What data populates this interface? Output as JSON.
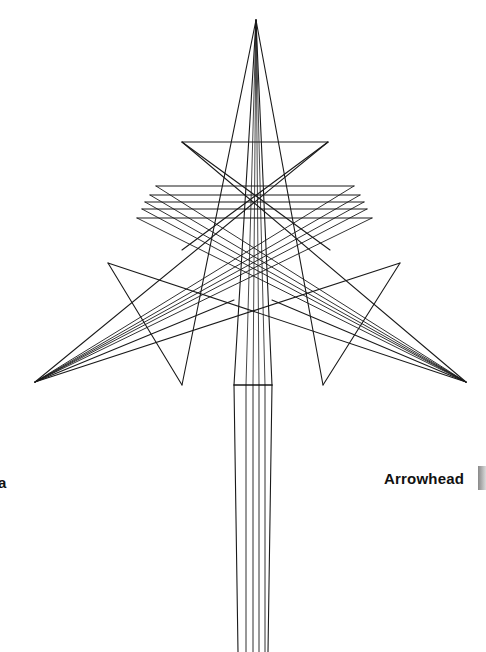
{
  "figure": {
    "title": "Arrowhead",
    "labels": {
      "right": "Arrowhead",
      "left_partial": "a"
    },
    "stroke_color": "#1a1a1a",
    "background": "#ffffff",
    "apex": [
      256,
      20
    ],
    "upper_triangle": {
      "top_left": [
        182,
        142
      ],
      "top_right": [
        328,
        142
      ],
      "bottom": [
        256,
        250
      ]
    },
    "stacked_bars": [
      {
        "y": 186,
        "x1": 156,
        "x2": 354
      },
      {
        "y": 195,
        "x1": 150,
        "x2": 360
      },
      {
        "y": 202,
        "x1": 145,
        "x2": 364
      },
      {
        "y": 209,
        "x1": 142,
        "x2": 367
      },
      {
        "y": 218,
        "x1": 137,
        "x2": 372
      }
    ],
    "left_wing": {
      "tip": [
        35,
        382
      ],
      "triangle": {
        "top": [
          108,
          263
        ],
        "bottom": [
          182,
          385
        ]
      }
    },
    "right_wing": {
      "tip": [
        466,
        382
      ],
      "triangle": {
        "top": [
          400,
          263
        ],
        "bottom": [
          323,
          385
        ]
      }
    },
    "stem": {
      "top_y": 385,
      "bottom_y": 652,
      "crossbar_y": 385,
      "x_left": 234,
      "x_right": 272,
      "inner_x": [
        246,
        253,
        259,
        265
      ]
    }
  }
}
